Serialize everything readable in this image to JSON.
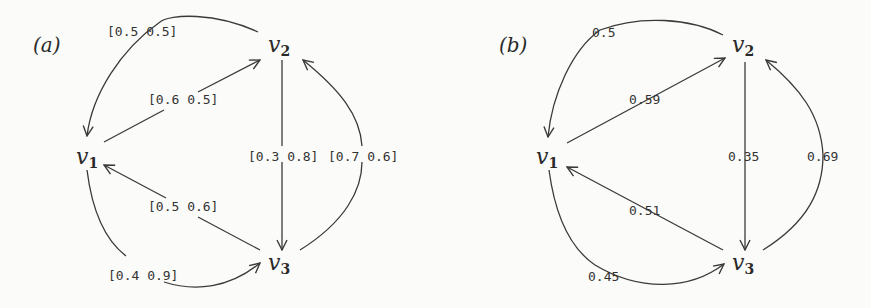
{
  "panels": [
    {
      "id": "a",
      "label": "(a)",
      "nodes": [
        {
          "id": "v1",
          "base": "v",
          "sub": "1"
        },
        {
          "id": "v2",
          "base": "v",
          "sub": "2"
        },
        {
          "id": "v3",
          "base": "v",
          "sub": "3"
        }
      ],
      "edges": [
        {
          "from": "v2",
          "to": "v1",
          "label": "[0.5 0.5]",
          "shape": "curved-outer"
        },
        {
          "from": "v1",
          "to": "v2",
          "label": "[0.6 0.5]",
          "shape": "straight"
        },
        {
          "from": "v2",
          "to": "v3",
          "label": "[0.3 0.8]",
          "shape": "straight"
        },
        {
          "from": "v3",
          "to": "v2",
          "label": "[0.7 0.6]",
          "shape": "curved-outer"
        },
        {
          "from": "v3",
          "to": "v1",
          "label": "[0.5 0.6]",
          "shape": "straight"
        },
        {
          "from": "v1",
          "to": "v3",
          "label": "[0.4 0.9]",
          "shape": "curved-outer"
        }
      ]
    },
    {
      "id": "b",
      "label": "(b)",
      "nodes": [
        {
          "id": "v1",
          "base": "v",
          "sub": "1"
        },
        {
          "id": "v2",
          "base": "v",
          "sub": "2"
        },
        {
          "id": "v3",
          "base": "v",
          "sub": "3"
        }
      ],
      "edges": [
        {
          "from": "v2",
          "to": "v1",
          "label": "0.5",
          "shape": "curved-outer"
        },
        {
          "from": "v1",
          "to": "v2",
          "label": "0.59",
          "shape": "straight"
        },
        {
          "from": "v2",
          "to": "v3",
          "label": "0.35",
          "shape": "straight"
        },
        {
          "from": "v3",
          "to": "v2",
          "label": "0.69",
          "shape": "curved-outer"
        },
        {
          "from": "v3",
          "to": "v1",
          "label": "0.51",
          "shape": "straight"
        },
        {
          "from": "v1",
          "to": "v3",
          "label": "0.45",
          "shape": "curved-outer"
        }
      ]
    }
  ],
  "colors": {
    "ink": "#2a2a2a",
    "background": "#fbfbf9"
  }
}
